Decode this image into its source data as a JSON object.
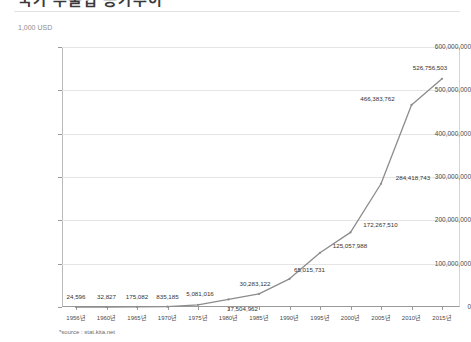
{
  "title": "국가 수출입 증가추이",
  "unit_label": "1,000 USD",
  "source_note": "*source : stat.kita.net",
  "colors": {
    "line": "#8c8c8c",
    "gridline": "#e4e4e4",
    "axis": "#9a9a9a",
    "text": "#333333"
  },
  "chart_data": {
    "type": "line",
    "title": "국가 수출입 증가추이",
    "xlabel": "",
    "ylabel": "1,000 USD",
    "ylim": [
      0,
      600000000
    ],
    "ytick_values": [
      0,
      100000000,
      200000000,
      300000000,
      400000000,
      500000000,
      600000000
    ],
    "ytick_labels": [
      "0",
      "100,000,000",
      "200,000,000",
      "300,000,000",
      "400,000,000",
      "500,000,000",
      "600,000,000"
    ],
    "grid": true,
    "legend": "none",
    "categories": [
      "1956년",
      "1960년",
      "1965년",
      "1970년",
      "1975년",
      "1980년",
      "1985년",
      "1990년",
      "1995년",
      "2000년",
      "2005년",
      "2010년",
      "2015년"
    ],
    "x": [
      1956,
      1960,
      1965,
      1970,
      1975,
      1980,
      1985,
      1990,
      1995,
      2000,
      2005,
      2010,
      2015
    ],
    "values": [
      24596,
      32827,
      175082,
      835185,
      5081016,
      17504962,
      30283122,
      65015731,
      125057988,
      172267510,
      284418743,
      466383762,
      526756503
    ],
    "data_labels": [
      "24,596",
      "32,827",
      "175,082",
      "835,185",
      "5,081,016",
      "17,504,962",
      "30,283,122",
      "65,015,731",
      "125,057,988",
      "172,267,510",
      "284,418,743",
      "466,383,762",
      "526,756,503"
    ]
  }
}
